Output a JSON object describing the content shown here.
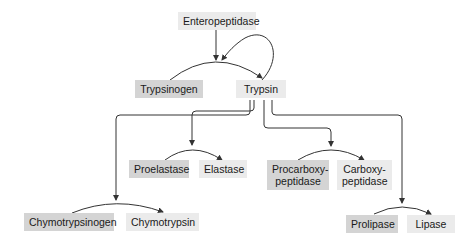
{
  "diagram": {
    "nodes": {
      "enteropeptidase": "Enteropeptidase",
      "trypsinogen": "Trypsinogen",
      "trypsin": "Trypsin",
      "proelastase": "Proelastase",
      "elastase": "Elastase",
      "procarboxypeptidase_1": "Procarboxy-",
      "procarboxypeptidase_2": "peptidase",
      "carboxypeptidase_1": "Carboxy-",
      "carboxypeptidase_2": "peptidase",
      "chymotrypsinogen": "Chymotrypsinogen",
      "chymotrypsin": "Chymotrypsin",
      "prolipase": "Prolipase",
      "lipase": "Lipase"
    },
    "edges": [
      {
        "from": "Trypsinogen",
        "to": "Trypsin",
        "catalyst": "Enteropeptidase"
      },
      {
        "from": "Trypsinogen",
        "to": "Trypsin",
        "catalyst": "Trypsin"
      },
      {
        "from": "Proelastase",
        "to": "Elastase",
        "catalyst": "Trypsin"
      },
      {
        "from": "Procarboxypeptidase",
        "to": "Carboxypeptidase",
        "catalyst": "Trypsin"
      },
      {
        "from": "Chymotrypsinogen",
        "to": "Chymotrypsin",
        "catalyst": "Trypsin"
      },
      {
        "from": "Prolipase",
        "to": "Lipase",
        "catalyst": "Trypsin"
      }
    ],
    "colors": {
      "zymogen_box": "#d4d4d4",
      "active_box": "#ebebeb",
      "line": "#333333"
    }
  }
}
